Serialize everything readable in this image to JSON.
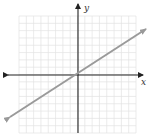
{
  "chart_data": {
    "type": "line",
    "title": "",
    "xlabel": "x",
    "ylabel": "y",
    "grid": true,
    "grid_cells": {
      "x": 16,
      "y": 16
    },
    "xlim": [
      -8,
      8
    ],
    "ylim": [
      -8,
      8
    ],
    "series": [
      {
        "name": "line through origin",
        "x": [
          -9.3,
          9.3
        ],
        "y": [
          -5.8,
          6.1
        ],
        "slope_approx": 0.65,
        "color": "#999999",
        "arrows": "both"
      }
    ],
    "tick_labels": [],
    "legend": null
  },
  "labels": {
    "x_axis": "x",
    "y_axis": "y"
  },
  "colors": {
    "grid": "#e2e2e2",
    "axis": "#222222",
    "line": "#9a9a9a"
  }
}
